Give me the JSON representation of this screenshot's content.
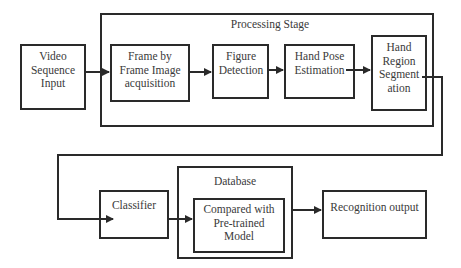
{
  "diagram": {
    "nodes": {
      "video_input": {
        "label": "Video\nSequence\nInput",
        "lines": [
          "Video",
          "Sequence",
          "Input"
        ]
      },
      "processing_stage": {
        "label": "Processing Stage"
      },
      "frame_acquisition": {
        "lines": [
          "Frame by",
          "Frame Image",
          "acquisition"
        ]
      },
      "figure_detection": {
        "lines": [
          "Figure",
          "Detection"
        ]
      },
      "hand_pose": {
        "lines": [
          "Hand Pose",
          "Estimation"
        ]
      },
      "hand_region": {
        "lines": [
          "Hand",
          "Region",
          "Segment",
          "ation"
        ]
      },
      "classifier": {
        "label": "Classifier"
      },
      "database": {
        "label": "Database"
      },
      "compared": {
        "lines": [
          "Compared with",
          "Pre-trained",
          "Model"
        ]
      },
      "recognition_output": {
        "label": "Recognition output"
      }
    },
    "edges": [
      {
        "from": "video_input",
        "to": "frame_acquisition"
      },
      {
        "from": "frame_acquisition",
        "to": "figure_detection"
      },
      {
        "from": "figure_detection",
        "to": "hand_pose"
      },
      {
        "from": "hand_pose",
        "to": "hand_region"
      },
      {
        "from": "hand_region",
        "to": "classifier"
      },
      {
        "from": "classifier",
        "to": "compared"
      },
      {
        "from": "database",
        "to": "recognition_output"
      }
    ],
    "colors": {
      "stroke": "#2a2a2a",
      "text": "#3a3a3a",
      "background": "#ffffff"
    }
  }
}
